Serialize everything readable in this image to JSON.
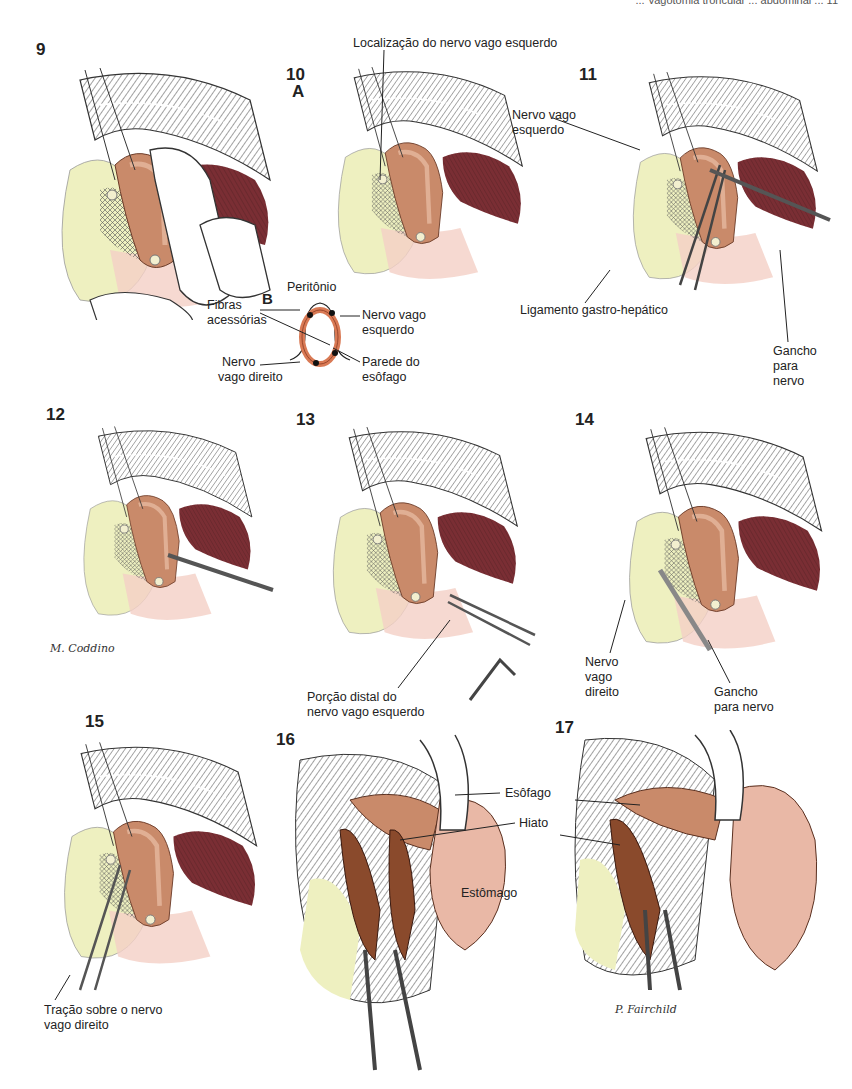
{
  "header": {
    "running_text": "... Vagotomia troncular ... abdominal ... 11"
  },
  "panels": [
    {
      "number": "9"
    },
    {
      "number": "10",
      "sub": "A"
    },
    {
      "number": "11"
    },
    {
      "number": "12"
    },
    {
      "number": "13"
    },
    {
      "number": "14"
    },
    {
      "number": "15"
    },
    {
      "number": "16"
    },
    {
      "number": "17"
    }
  ],
  "inset_b": {
    "letter": "B",
    "labels": {
      "peritonio": "Peritônio",
      "fibras": [
        "Fibras",
        "acessórias"
      ],
      "nervo_esq": [
        "Nervo vago",
        "esquerdo"
      ],
      "nervo_dir": [
        "Nervo",
        "vago direito"
      ],
      "parede": [
        "Parede do",
        "esôfago"
      ]
    }
  },
  "labels": {
    "localizacao": "Localização do nervo vago esquerdo",
    "p11_nervo": [
      "Nervo vago",
      "esquerdo"
    ],
    "p11_ligamento": "Ligamento gastro-hepático",
    "p11_gancho": [
      "Gancho",
      "para",
      "nervo"
    ],
    "p13_porcao": [
      "Porção distal do",
      "nervo vago esquerdo"
    ],
    "p14_nervo": [
      "Nervo",
      "vago",
      "direito"
    ],
    "p14_gancho": [
      "Gancho",
      "para nervo"
    ],
    "p15_tracao": [
      "Tração sobre o nervo",
      "vago direito"
    ],
    "p16_esofago": "Esôfago",
    "p16_hiato": "Hiato",
    "p16_estomago": "Estômago"
  },
  "signatures": {
    "coddino": "M. Coddino",
    "fairchild": "P. Fairchild"
  },
  "colors": {
    "esophagus": "#c98a6a",
    "muscle_dark": "#7a2e34",
    "fat": "#eef0c0",
    "pink": "#f2c9c0",
    "line": "#333333"
  }
}
